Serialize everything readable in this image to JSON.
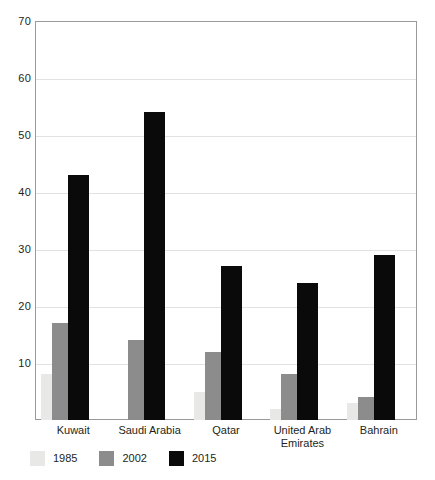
{
  "chart_data": {
    "type": "bar",
    "title": "",
    "subtitle": "",
    "xlabel": "",
    "ylabel": "",
    "ylim": [
      0,
      70
    ],
    "yticks": [
      10,
      20,
      30,
      40,
      50,
      60,
      70
    ],
    "grid": true,
    "legend_position": "bottom-left",
    "bar_style": "overlapping",
    "categories": [
      "Kuwait",
      "Saudi Arabia",
      "Qatar",
      "United Arab Emirates",
      "Bahrain"
    ],
    "category_lines": [
      [
        "Kuwait"
      ],
      [
        "Saudi Arabia"
      ],
      [
        "Qatar"
      ],
      [
        "United Arab",
        "Emirates"
      ],
      [
        "Bahrain"
      ]
    ],
    "series": [
      {
        "name": "1985",
        "color": "#e8e8e6",
        "values": [
          8,
          0,
          5,
          2,
          3
        ]
      },
      {
        "name": "2002",
        "color": "#8c8c8c",
        "values": [
          17,
          14,
          12,
          8,
          4
        ]
      },
      {
        "name": "2015",
        "color": "#0a0a0a",
        "values": [
          43,
          54,
          27,
          24,
          29
        ]
      }
    ]
  },
  "legend": {
    "items": [
      {
        "label": "1985",
        "color": "#e8e8e6"
      },
      {
        "label": "2002",
        "color": "#8c8c8c"
      },
      {
        "label": "2015",
        "color": "#0a0a0a"
      }
    ]
  },
  "axis": {
    "y_tick_labels": [
      "70",
      "60",
      "50",
      "40",
      "30",
      "20",
      "10"
    ]
  }
}
